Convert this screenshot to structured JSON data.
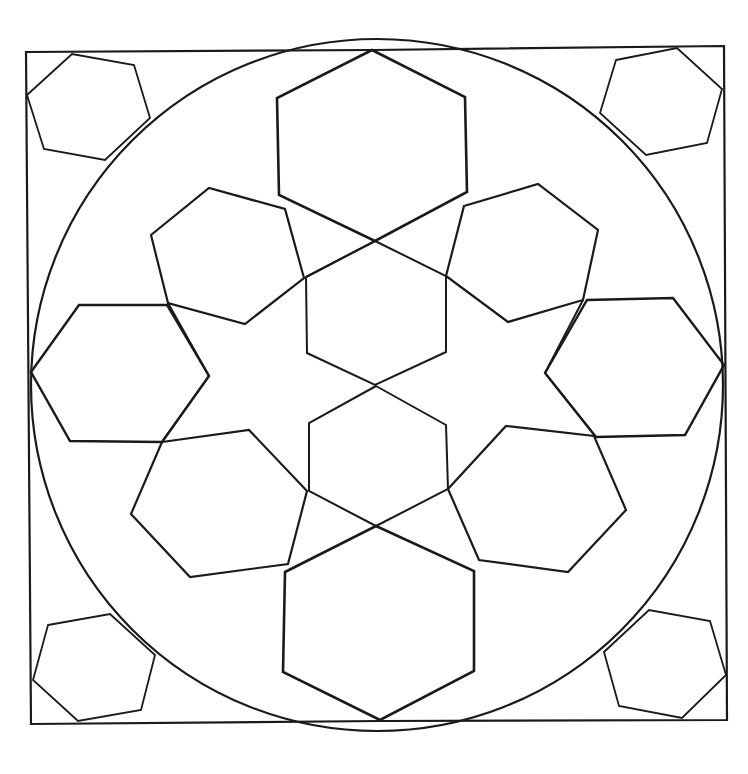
{
  "drawing": {
    "title": "Geometric hexagon rosette coloring page",
    "stroke_color": "#1a1a1a",
    "background": "#ffffff",
    "frame": {
      "points": [
        [
          26,
          52
        ],
        [
          373,
          50
        ],
        [
          724,
          46
        ],
        [
          727,
          720
        ],
        [
          380,
          721
        ],
        [
          31,
          724
        ]
      ],
      "stroke_width": 2.2
    },
    "circle": {
      "cx": 377,
      "cy": 385,
      "r": 346,
      "stroke_width": 2.2
    },
    "corner_hexagons": [
      {
        "name": "top-left",
        "points": [
          [
            27,
            95
          ],
          [
            72,
            54
          ],
          [
            134,
            65
          ],
          [
            150,
            118
          ],
          [
            105,
            160
          ],
          [
            44,
            149
          ]
        ]
      },
      {
        "name": "top-right",
        "points": [
          [
            616,
            60
          ],
          [
            677,
            48
          ],
          [
            722,
            89
          ],
          [
            707,
            143
          ],
          [
            646,
            155
          ],
          [
            600,
            113
          ]
        ]
      },
      {
        "name": "bottom-left",
        "points": [
          [
            48,
            625
          ],
          [
            110,
            614
          ],
          [
            155,
            655
          ],
          [
            141,
            710
          ],
          [
            78,
            721
          ],
          [
            33,
            680
          ]
        ]
      },
      {
        "name": "bottom-right",
        "points": [
          [
            604,
            652
          ],
          [
            649,
            610
          ],
          [
            710,
            621
          ],
          [
            726,
            675
          ],
          [
            682,
            718
          ],
          [
            619,
            706
          ]
        ]
      }
    ],
    "large_hexagons": [
      {
        "name": "top",
        "points": [
          [
            372,
            50
          ],
          [
            465,
            97
          ],
          [
            467,
            192
          ],
          [
            375,
            241
          ],
          [
            279,
            195
          ],
          [
            277,
            98
          ]
        ],
        "stroke_width": 2.6
      },
      {
        "name": "bottom",
        "points": [
          [
            285,
            572
          ],
          [
            376,
            526
          ],
          [
            474,
            571
          ],
          [
            474,
            671
          ],
          [
            380,
            720
          ],
          [
            283,
            672
          ]
        ],
        "stroke_width": 2.6
      },
      {
        "name": "left",
        "points": [
          [
            31,
            372
          ],
          [
            79,
            305
          ],
          [
            167,
            305
          ],
          [
            209,
            376
          ],
          [
            162,
            442
          ],
          [
            70,
            441
          ]
        ],
        "stroke_width": 2.4
      },
      {
        "name": "right",
        "points": [
          [
            545,
            373
          ],
          [
            587,
            300
          ],
          [
            673,
            298
          ],
          [
            724,
            365
          ],
          [
            685,
            435
          ],
          [
            596,
            437
          ]
        ],
        "stroke_width": 2.4
      }
    ],
    "ring_hexagons": [
      {
        "name": "upper-left",
        "points": [
          [
            151,
            235
          ],
          [
            209,
            188
          ],
          [
            285,
            209
          ],
          [
            304,
            278
          ],
          [
            245,
            324
          ],
          [
            168,
            303
          ]
        ]
      },
      {
        "name": "upper-right",
        "points": [
          [
            464,
            206
          ],
          [
            538,
            184
          ],
          [
            598,
            230
          ],
          [
            583,
            300
          ],
          [
            508,
            322
          ],
          [
            446,
            276
          ]
        ]
      },
      {
        "name": "lower-left",
        "points": [
          [
            162,
            442
          ],
          [
            249,
            430
          ],
          [
            307,
            491
          ],
          [
            288,
            564
          ],
          [
            190,
            577
          ],
          [
            131,
            514
          ]
        ]
      },
      {
        "name": "lower-right",
        "points": [
          [
            506,
            426
          ],
          [
            594,
            436
          ],
          [
            626,
            510
          ],
          [
            568,
            572
          ],
          [
            479,
            560
          ],
          [
            448,
            489
          ]
        ]
      }
    ],
    "center_hexagons": [
      {
        "name": "center-upper",
        "points": [
          [
            375,
            241
          ],
          [
            446,
            276
          ],
          [
            446,
            352
          ],
          [
            375,
            385
          ],
          [
            307,
            353
          ],
          [
            306,
            277
          ]
        ]
      },
      {
        "name": "center-lower",
        "points": [
          [
            376,
            386
          ],
          [
            446,
            425
          ],
          [
            448,
            489
          ],
          [
            376,
            526
          ],
          [
            309,
            491
          ],
          [
            309,
            423
          ]
        ]
      }
    ],
    "connector_lines": [
      {
        "name": "top-hex-to-ring-left",
        "points": [
          [
            375,
            241
          ],
          [
            306,
            277
          ]
        ]
      },
      {
        "name": "left-to-center",
        "points": [
          [
            209,
            376
          ],
          [
            162,
            442
          ]
        ]
      },
      {
        "name": "ring-ul-to-left",
        "points": [
          [
            168,
            303
          ],
          [
            209,
            376
          ]
        ]
      },
      {
        "name": "ring-ur-to-right",
        "points": [
          [
            583,
            300
          ],
          [
            545,
            373
          ]
        ]
      },
      {
        "name": "right-to-ring-lr",
        "points": [
          [
            545,
            373
          ],
          [
            596,
            437
          ]
        ]
      }
    ]
  }
}
